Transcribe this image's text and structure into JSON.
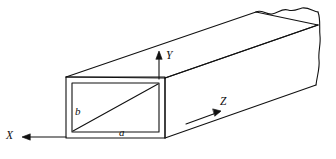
{
  "figure": {
    "name": "rectangular-waveguide-3d",
    "background_color": "#ffffff",
    "line_color": "#111111",
    "stroke_width": 1.1
  },
  "axes": {
    "x": {
      "label": "X",
      "direction": "left",
      "arrowhead": "left"
    },
    "y": {
      "label": "Y",
      "direction": "up",
      "arrowhead": "up"
    },
    "z": {
      "label": "Z",
      "direction": "up-right",
      "arrowhead": "up-right"
    }
  },
  "dimensions": {
    "a": {
      "label": "a",
      "meaning": "broad wall width of rectangular cross-section"
    },
    "b": {
      "label": "b",
      "meaning": "narrow wall height of rectangular cross-section"
    }
  },
  "features": {
    "break_edge": "wavy break line at far end indicating guide continues",
    "diagonal": "diagonal line across front aperture",
    "wall": "double outline showing finite wall thickness of hollow guide"
  }
}
